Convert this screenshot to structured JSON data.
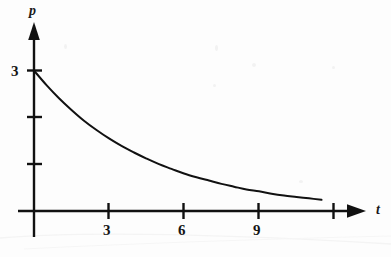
{
  "figure": {
    "background_color": "#fdfdfd",
    "ink_color": "#111111",
    "axis_label_x": "t",
    "axis_label_y": "p"
  },
  "labels": {
    "y_tick_3": "3",
    "x_tick_3": "3",
    "x_tick_6": "6",
    "x_tick_9": "9"
  },
  "chart_data": {
    "type": "line",
    "title": "",
    "subtitle": "",
    "xlabel": "t",
    "ylabel": "p",
    "xlim": [
      0,
      13.2
    ],
    "ylim": [
      0,
      3.6
    ],
    "grid": false,
    "legend": null,
    "legend_position": "none",
    "x_ticks": [
      3,
      6,
      9,
      12
    ],
    "x_tick_labels": [
      "3",
      "6",
      "9",
      ""
    ],
    "y_ticks": [
      1,
      2,
      3
    ],
    "y_tick_labels": [
      "",
      "",
      "3"
    ],
    "axis_arrows": [
      "x-right",
      "y-up"
    ],
    "annotations": [],
    "series": [
      {
        "name": "p(t)",
        "color": "#111111",
        "line_width": 2,
        "x": [
          0,
          0.5,
          1,
          1.5,
          2,
          2.5,
          3,
          3.5,
          4,
          4.5,
          5,
          5.5,
          6,
          6.5,
          7,
          7.5,
          8,
          8.5,
          9,
          9.5,
          10,
          10.5,
          11,
          11.5
        ],
        "y": [
          3.0,
          2.69,
          2.41,
          2.16,
          1.93,
          1.73,
          1.55,
          1.39,
          1.25,
          1.12,
          1.0,
          0.9,
          0.8,
          0.72,
          0.65,
          0.58,
          0.52,
          0.46,
          0.42,
          0.37,
          0.33,
          0.3,
          0.27,
          0.24
        ]
      }
    ]
  }
}
